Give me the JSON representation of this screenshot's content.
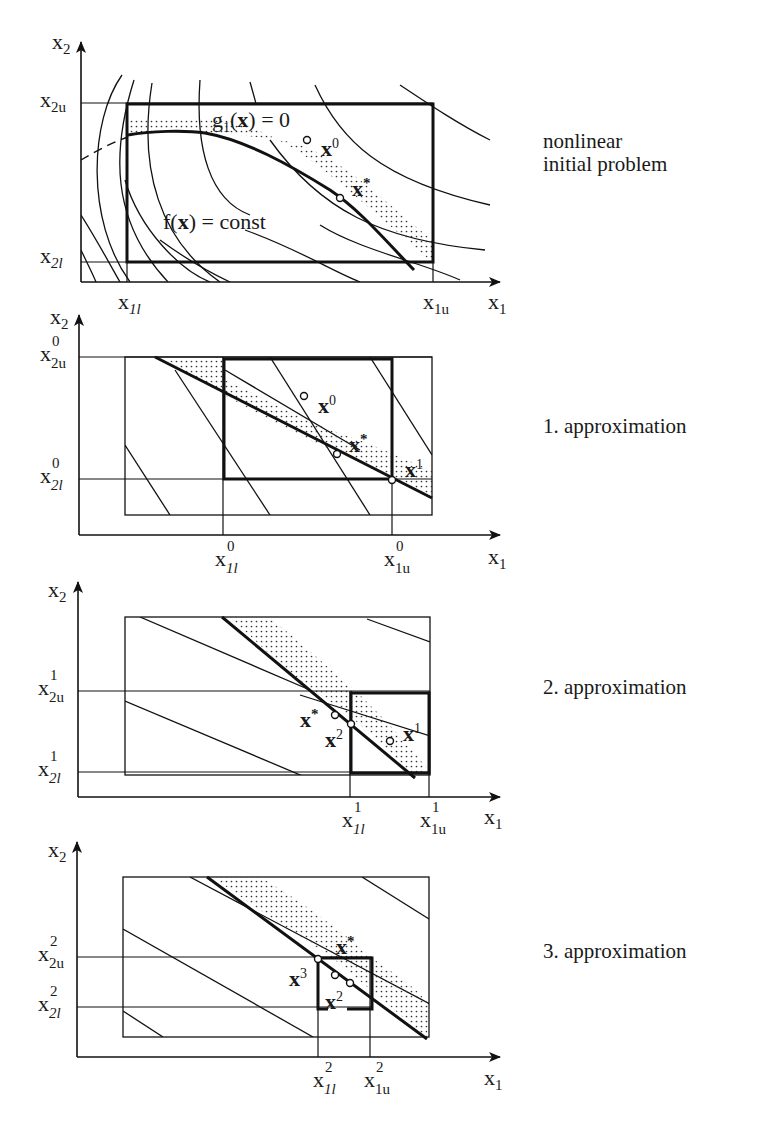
{
  "figure": {
    "panels": [
      {
        "id": "initial",
        "caption": "nonlinear initial problem",
        "caption_lines": [
          "nonlinear",
          "initial problem"
        ],
        "axes": {
          "x": "x1",
          "y": "x2"
        },
        "ticks": {
          "x": [
            "x1l",
            "x1u"
          ],
          "y": [
            "x2u",
            "x2l"
          ]
        },
        "annotations": [
          "g1(x) = 0",
          "f(x) = const",
          "x^0",
          "x*"
        ]
      },
      {
        "id": "approx1",
        "caption": "1. approximation",
        "axes": {
          "x": "x1",
          "y": "x2"
        },
        "ticks": {
          "x": [
            "x1l^0",
            "x1u^0"
          ],
          "y": [
            "x2u^0",
            "x2l^0"
          ]
        },
        "annotations": [
          "x^0",
          "x*",
          "x^1"
        ]
      },
      {
        "id": "approx2",
        "caption": "2. approximation",
        "axes": {
          "x": "x1",
          "y": "x2"
        },
        "ticks": {
          "x": [
            "x1l^1",
            "x1u^1"
          ],
          "y": [
            "x2u^1",
            "x2l^1"
          ]
        },
        "annotations": [
          "x*",
          "x^2",
          "x^1"
        ]
      },
      {
        "id": "approx3",
        "caption": "3. approximation",
        "axes": {
          "x": "x1",
          "y": "x2"
        },
        "ticks": {
          "x": [
            "x1l^2",
            "x1u^2"
          ],
          "y": [
            "x2u^2",
            "x2l^2"
          ]
        },
        "annotations": [
          "x*",
          "x^3",
          "x^2"
        ]
      }
    ]
  },
  "captions": {
    "p0_line1": "nonlinear",
    "p0_line2": "initial problem",
    "p1": "1. approximation",
    "p2": "2. approximation",
    "p3": "3. approximation"
  },
  "labels": {
    "g1": "g",
    "g1_sub": "1",
    "g1_paren_open": "(",
    "g1_x": "x",
    "g1_rest": ") = 0",
    "f": "f(",
    "f_x": "x",
    "f_rest": ") = const",
    "x": "x",
    "star": "*",
    "sup0": "0",
    "sup1": "1",
    "sup2": "2",
    "sup3": "3",
    "sub1": "1",
    "sub2": "2",
    "sub_l": "l",
    "sub_u": "u",
    "sub1l": "1l",
    "sub1u": "1u",
    "sub2l": "2l",
    "sub2u": "2u"
  },
  "colors": {
    "ink": "#1a1a1a",
    "background": "#ffffff",
    "stipple": "#333333"
  }
}
